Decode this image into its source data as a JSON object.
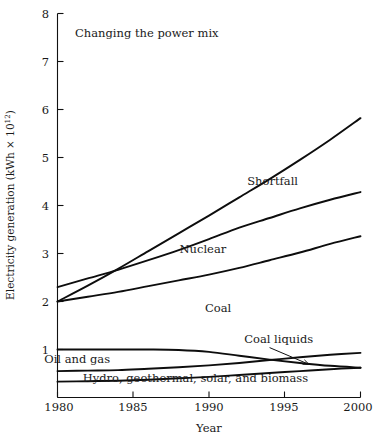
{
  "chart_data": {
    "type": "line",
    "title": "Changing the power mix",
    "xlabel": "Year",
    "ylabel": "Electricity generation (kWh × 10",
    "ylabel_sup": "12",
    "ylabel_tail": ")",
    "xlim": [
      1980,
      2000
    ],
    "ylim": [
      0,
      8
    ],
    "grid": false,
    "legend_position": "inline-annotations",
    "xticks": [
      1980,
      1985,
      1990,
      1995,
      2000
    ],
    "xtick_labels": [
      "1980",
      "1985",
      "1990",
      "1995",
      "2000"
    ],
    "yticks": [
      1,
      2,
      3,
      4,
      5,
      6,
      7,
      8
    ],
    "ytick_labels": [
      "1",
      "2",
      "3",
      "4",
      "5",
      "6",
      "7",
      "8"
    ],
    "x": [
      1980,
      1982,
      1984,
      1986,
      1988,
      1990,
      1992,
      1994,
      1996,
      1998,
      2000
    ],
    "series": [
      {
        "name": "Shortfall",
        "label": "Shortfall",
        "label_x": 1994.2,
        "label_y": 4.42,
        "values": [
          2.0,
          2.33,
          2.68,
          3.05,
          3.42,
          3.79,
          4.17,
          4.55,
          4.95,
          5.37,
          5.82
        ]
      },
      {
        "name": "Nuclear",
        "label": "Nuclear",
        "label_x": 1989.6,
        "label_y": 3.02,
        "values": [
          2.3,
          2.48,
          2.66,
          2.86,
          3.07,
          3.3,
          3.54,
          3.74,
          3.94,
          4.12,
          4.28
        ]
      },
      {
        "name": "Coal",
        "label": "Coal",
        "label_x": 1990.6,
        "label_y": 1.78,
        "values": [
          2.0,
          2.1,
          2.2,
          2.32,
          2.44,
          2.56,
          2.7,
          2.86,
          3.02,
          3.2,
          3.36
        ]
      },
      {
        "name": "Oil and gas",
        "label": "Oil and gas",
        "label_x": 1981.3,
        "label_y": 0.73,
        "values": [
          1.0,
          1.0,
          1.0,
          1.0,
          0.99,
          0.95,
          0.87,
          0.79,
          0.72,
          0.66,
          0.62
        ]
      },
      {
        "name": "Coal liquids",
        "label": "Coal liquids",
        "label_x": 1994.6,
        "label_y": 1.13,
        "values": [
          0.55,
          0.56,
          0.57,
          0.6,
          0.63,
          0.67,
          0.72,
          0.78,
          0.84,
          0.89,
          0.93
        ]
      },
      {
        "name": "Hydro, geothermal, solar, and biomass",
        "label": "Hydro, geothermal, solar, and biomass",
        "label_x": 1989.1,
        "label_y": 0.33,
        "values": [
          0.33,
          0.34,
          0.35,
          0.37,
          0.4,
          0.43,
          0.47,
          0.51,
          0.55,
          0.59,
          0.62
        ]
      }
    ],
    "annotations": [
      {
        "name": "coal-liquids-leader",
        "text": "Coal liquids",
        "from_x": 1994.0,
        "from_y": 1.04,
        "to_x": 1996.6,
        "to_y": 0.69
      }
    ]
  }
}
